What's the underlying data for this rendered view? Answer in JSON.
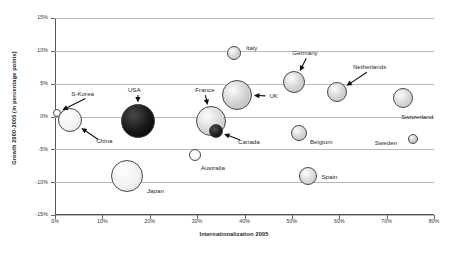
{
  "chart_data": {
    "type": "scatter",
    "subtype": "bubble",
    "title": "",
    "xlabel": "Internationalization 2005",
    "ylabel": "Growth 2000-2005 (in percentage points)",
    "xlim": [
      0,
      80
    ],
    "ylim": [
      -15,
      15
    ],
    "xtick_labels": [
      "0%",
      "10%",
      "20%",
      "30%",
      "40%",
      "50%",
      "60%",
      "70%",
      "80%"
    ],
    "xticks": [
      0,
      10,
      20,
      30,
      40,
      50,
      60,
      70,
      80
    ],
    "ytick_labels": [
      "15%",
      "10%",
      "5%",
      "0%",
      "-5%",
      "-10%",
      "-15%"
    ],
    "yticks": [
      15,
      10,
      5,
      0,
      -5,
      -10,
      -15
    ],
    "grid": "horizontal",
    "legend": "none",
    "unit_note": "x = Internationalization 2005 (%), y = Growth 2000-2005 (percentage points), size = bubble area",
    "points": [
      {
        "name": "S-Korea",
        "x": 0.5,
        "y": 0.6,
        "r": 4,
        "fill": "#ffffff",
        "label_dx": 14,
        "label_dy": -22,
        "leader": "arrow-down-left"
      },
      {
        "name": "China",
        "x": 3.2,
        "y": -0.6,
        "r": 12,
        "fill": "#f4f4f4",
        "label_dx": 26,
        "label_dy": 18,
        "leader": "arrow-up-left"
      },
      {
        "name": "USA",
        "x": 17.5,
        "y": -0.7,
        "r": 17,
        "fill": "#161616",
        "label_dx": -10,
        "label_dy": -34,
        "leader": "arrow-down-right"
      },
      {
        "name": "Japan",
        "x": 15.2,
        "y": -9.0,
        "r": 16,
        "fill": "#f2f2f2",
        "label_dx": 20,
        "label_dy": 12,
        "leader": "none"
      },
      {
        "name": "Australia",
        "x": 29.5,
        "y": -5.8,
        "r": 6,
        "fill": "#fbfbfb",
        "label_dx": 6,
        "label_dy": 10,
        "leader": "none"
      },
      {
        "name": "France",
        "x": 33.0,
        "y": -0.7,
        "r": 15,
        "fill": "#d8d8d8",
        "label_dx": -16,
        "label_dy": -34,
        "leader": "arrow-down-right"
      },
      {
        "name": "Canada",
        "x": 34.0,
        "y": -2.2,
        "r": 7,
        "fill": "#1f1f1f",
        "label_dx": 22,
        "label_dy": 8,
        "leader": "arrow-up-left"
      },
      {
        "name": "UK",
        "x": 38.5,
        "y": 3.3,
        "r": 15,
        "fill": "#cfcfcf",
        "label_dx": 32,
        "label_dy": -2,
        "leader": "arrow-left"
      },
      {
        "name": "Italy",
        "x": 37.8,
        "y": 9.7,
        "r": 7,
        "fill": "#d5d5d5",
        "label_dx": 12,
        "label_dy": -8,
        "leader": "none"
      },
      {
        "name": "Germany",
        "x": 50.5,
        "y": 5.2,
        "r": 11,
        "fill": "#d2d2d2",
        "label_dx": -2,
        "label_dy": -32,
        "leader": "arrow-down-left"
      },
      {
        "name": "Netherlands",
        "x": 59.5,
        "y": 3.7,
        "r": 10,
        "fill": "#d2d2d2",
        "label_dx": 16,
        "label_dy": -28,
        "leader": "arrow-down-left"
      },
      {
        "name": "Switzerland",
        "x": 73.5,
        "y": 2.8,
        "r": 10,
        "fill": "#d6d6d6",
        "label_dx": -2,
        "label_dy": 16,
        "leader": "none"
      },
      {
        "name": "Belgium",
        "x": 51.5,
        "y": -2.5,
        "r": 8,
        "fill": "#d4d4d4",
        "label_dx": 11,
        "label_dy": 6,
        "leader": "none"
      },
      {
        "name": "Sweden",
        "x": 75.5,
        "y": -3.5,
        "r": 5,
        "fill": "#c8c8c8",
        "label_dx": -38,
        "label_dy": 1,
        "leader": "none"
      },
      {
        "name": "Spain",
        "x": 53.5,
        "y": -9.0,
        "r": 9,
        "fill": "#d9d9d9",
        "label_dx": 13,
        "label_dy": -2,
        "leader": "none"
      }
    ]
  },
  "colors": {
    "grid": "#b9b9b9",
    "axis": "#555555",
    "bubble_stroke": "#4a4a4a",
    "text": "#2a2a2a",
    "background": "#ffffff"
  }
}
